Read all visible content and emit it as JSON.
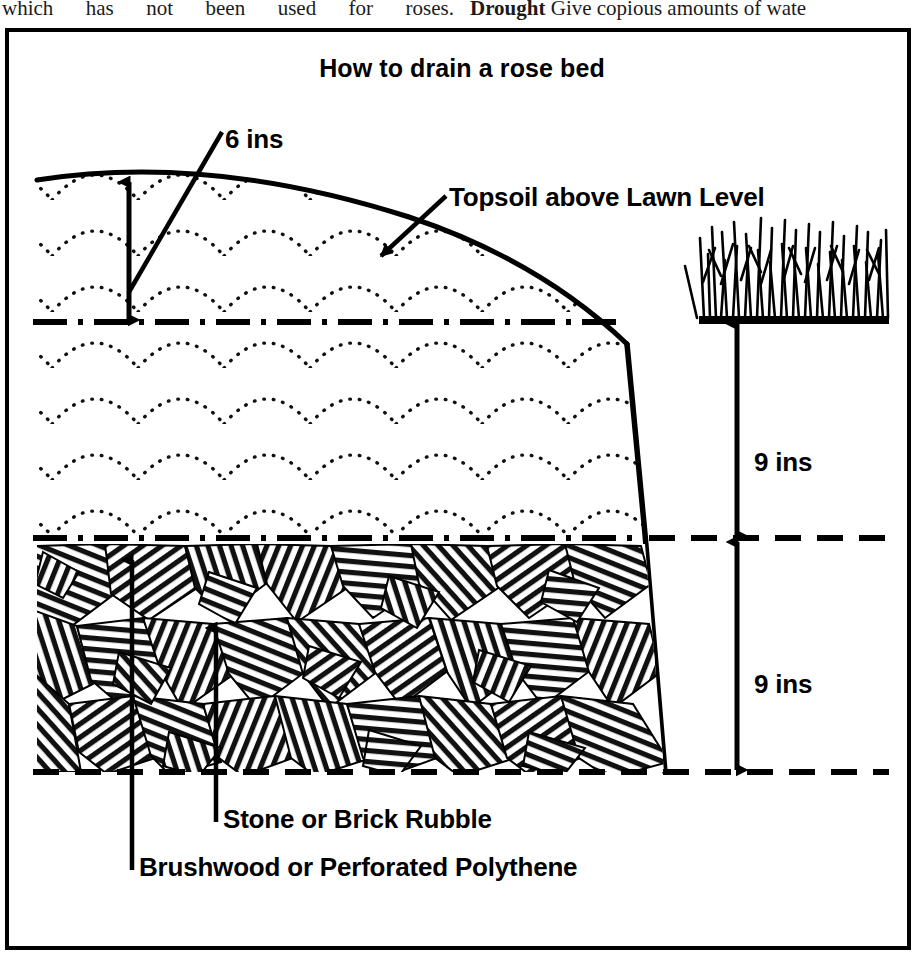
{
  "page_text": {
    "left_column_fragment": "which has not been used for roses.",
    "right_column_bold_lead": "Drought",
    "right_column_fragment": "Give copious amounts of wate"
  },
  "figure": {
    "title": "How to drain a rose bed",
    "labels": {
      "depth_topsoil_above_lawn": "6 ins",
      "topsoil_callout": "Topsoil above Lawn Level",
      "depth_topsoil_layer": "9 ins",
      "depth_rubble_layer": "9 ins",
      "rubble_callout": "Stone or Brick Rubble",
      "membrane_callout": "Brushwood or Perforated Polythene"
    },
    "colors": {
      "ink": "#000000",
      "paper": "#ffffff"
    },
    "layers": [
      {
        "name": "topsoil-mound",
        "texture": "dotted-scallop",
        "label": "Topsoil above Lawn Level"
      },
      {
        "name": "topsoil-below-lawn",
        "texture": "dotted-scallop",
        "depth": "9 ins"
      },
      {
        "name": "brushwood-or-polythene-membrane",
        "texture": "dash-dot-line",
        "label": "Brushwood or Perforated Polythene"
      },
      {
        "name": "rubble-drainage",
        "texture": "hatched-stones",
        "depth": "9 ins",
        "label": "Stone or Brick Rubble"
      },
      {
        "name": "lawn-turf",
        "texture": "grass-blades",
        "label": "Lawn Level"
      }
    ]
  }
}
